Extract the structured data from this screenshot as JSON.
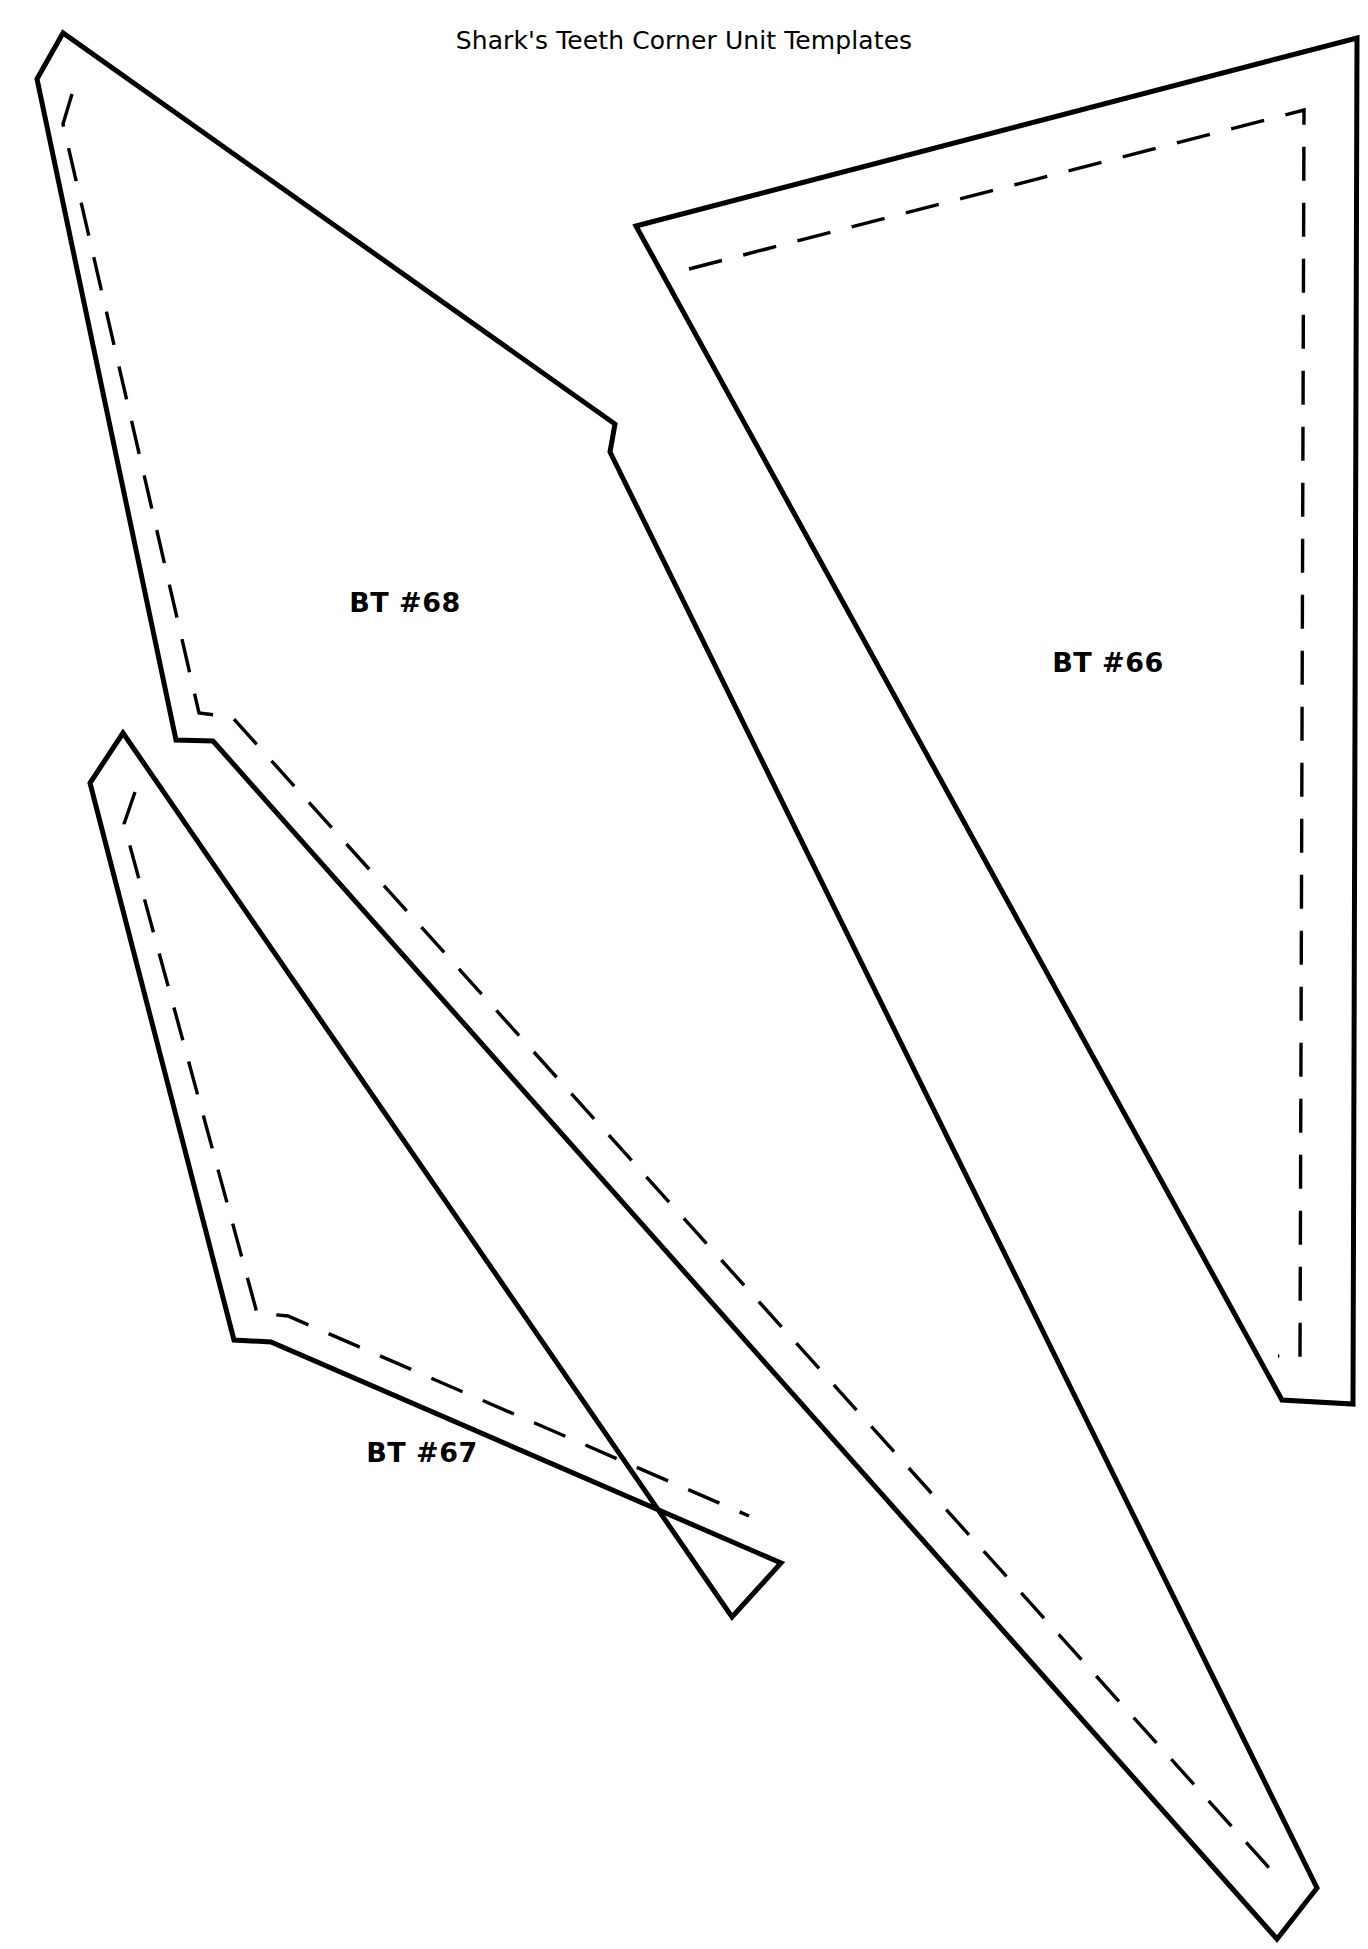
{
  "document": {
    "title": "Shark's Teeth Corner Unit Templates",
    "background_color": "#ffffff",
    "line_color": "#000000",
    "page_width": 1368,
    "page_height": 1949
  },
  "templates": [
    {
      "id": "bt-68",
      "label": "BT #68",
      "label_x": 405,
      "label_y": 612,
      "cut_points": "63,33 37,79 176,740 213,741 1277,1939 1317,1888 610,452 615,424",
      "seam_points": "72,94 63,124 199,713 232,717 1271,1870",
      "description": "elongated kite-shaped quilting template with solid cutting line and dashed seam allowance line"
    },
    {
      "id": "bt-66",
      "label": "BT #66",
      "label_x": 1108,
      "label_y": 672,
      "cut_points": "636,226 1357,38 1353,1404 1282,1400",
      "seam_points": "689,269 1304,110 1300,1358 1278,1356",
      "description": "long narrow wedge quilting template with solid cutting line and dashed seam allowance line"
    },
    {
      "id": "bt-67",
      "label": "BT #67",
      "label_x": 422,
      "label_y": 1462,
      "cut_points": "123,733 90,783 234,1340 271,1342 781,1563 732,1617",
      "seam_points": "135,792 124,824 257,1313 288,1316 749,1516",
      "description": "elongated kite-shaped quilting template with solid cutting line and dashed seam allowance line"
    }
  ]
}
